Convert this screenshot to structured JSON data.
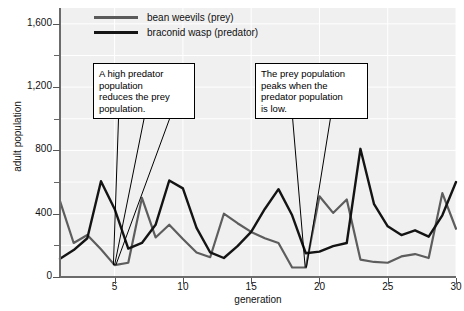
{
  "chart_data": {
    "type": "line",
    "title": "",
    "xlabel": "generation",
    "ylabel": "adult population",
    "xlim": [
      1,
      30
    ],
    "ylim": [
      0,
      1700
    ],
    "grid": true,
    "legend_position": "top-left",
    "x": [
      1,
      2,
      3,
      4,
      5,
      6,
      7,
      8,
      9,
      10,
      11,
      12,
      13,
      14,
      15,
      16,
      17,
      18,
      19,
      20,
      21,
      22,
      23,
      24,
      25,
      26,
      27,
      28,
      29,
      30
    ],
    "yticks": [
      0,
      400,
      800,
      1200,
      1600
    ],
    "ytick_labels": [
      "0",
      "400",
      "800",
      "1,200",
      "1,600"
    ],
    "yticks_minor": [
      200,
      600,
      1000,
      1400
    ],
    "xticks": [
      5,
      10,
      15,
      20,
      25,
      30
    ],
    "xtick_labels": [
      "5",
      "10",
      "15",
      "20",
      "25",
      "30"
    ],
    "series": [
      {
        "name": "bean weevils (prey)",
        "color": "#5d5d5d",
        "values": [
          480,
          215,
          265,
          175,
          75,
          90,
          500,
          250,
          330,
          240,
          155,
          125,
          400,
          340,
          285,
          245,
          215,
          60,
          60,
          510,
          405,
          490,
          110,
          95,
          90,
          130,
          145,
          120,
          530,
          305
        ]
      },
      {
        "name": "braconid wasp (predator)",
        "color": "#141414",
        "values": [
          115,
          170,
          245,
          605,
          430,
          180,
          215,
          330,
          610,
          560,
          310,
          155,
          120,
          195,
          285,
          430,
          555,
          390,
          150,
          160,
          195,
          215,
          810,
          460,
          320,
          265,
          295,
          255,
          390,
          600
        ]
      }
    ],
    "annotations": [
      {
        "text": "A high predator population reduces the prey population.",
        "lines": [
          "A high predator",
          "population",
          "reduces the prey",
          "population."
        ],
        "targets": [
          4,
          5,
          6
        ]
      },
      {
        "text": "The prey population peaks when the predator population is low.",
        "lines": [
          "The prey population",
          "peaks when the",
          "predator population",
          "is low."
        ],
        "targets": [
          19,
          20
        ]
      }
    ]
  },
  "legend": {
    "items": [
      {
        "label": "bean weevils (prey)",
        "color": "#5d5d5d"
      },
      {
        "label": "braconid wasp (predator)",
        "color": "#141414"
      }
    ]
  },
  "axes": {
    "y_title": "adult population",
    "x_title": "generation"
  }
}
